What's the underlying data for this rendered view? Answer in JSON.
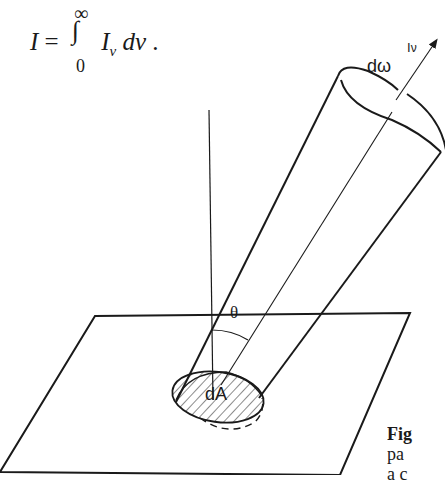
{
  "equation": {
    "lhs": "I",
    "equals": "=",
    "integral": "∫",
    "upper_limit": "∞",
    "lower_limit": "0",
    "integrand": "I",
    "integrand_subscript": "ν",
    "differential": "dν",
    "trailing": "."
  },
  "diagram": {
    "labels": {
      "intensity": "I",
      "intensity_sub": "ν",
      "solid_angle": "dω",
      "angle": "θ",
      "area": "dA"
    },
    "colors": {
      "stroke": "#1a1a1a",
      "background": "#ffffff"
    }
  },
  "caption": {
    "line1": "Fig",
    "line2": "pa",
    "line3": "a c"
  }
}
